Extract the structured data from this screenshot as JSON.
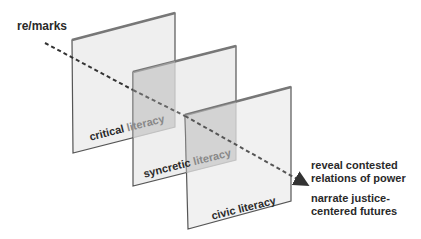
{
  "start_label": "re/marks",
  "layers": [
    {
      "label_part1": "critical ",
      "label_part2": "literacy"
    },
    {
      "label_part1": "syncretic ",
      "label_part2": "literacy"
    },
    {
      "label_part1": "civic ",
      "label_part2": "literacy"
    }
  ],
  "outcomes": [
    {
      "line1": "reveal contested",
      "line2": "relations of power"
    },
    {
      "line1": "narrate justice-",
      "line2": "centered futures"
    }
  ],
  "colors": {
    "panel_fill": "#ececec",
    "panel_edge": "#555555",
    "overlap_fill": "#c4c4c4",
    "arrow": "#333333",
    "text": "#2a2a2a"
  }
}
